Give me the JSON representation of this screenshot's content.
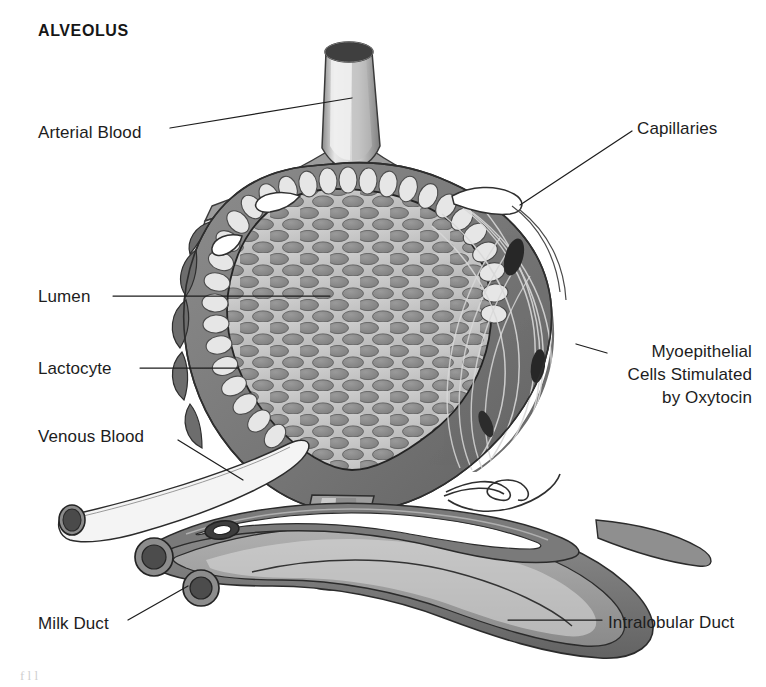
{
  "figure": {
    "title": "ALVEOLUS",
    "width": 766,
    "height": 687,
    "background": "#ffffff",
    "caption_fragment": "f      l      l"
  },
  "palette": {
    "ink": "#1d1d1d",
    "outline": "#2b2b2b",
    "wall_dark": "#6f6f6f",
    "wall_mid": "#8d8d8d",
    "wall_light": "#b7b7b7",
    "lumen_bg": "#c6c6c6",
    "globule": "#8a8a8a",
    "lactocyte": "#e2e2e2",
    "vessel_fill": "#dcdcdc",
    "vessel_wall": "#7d7d7d",
    "nucleus": "#3a3a3a",
    "duct_dark": "#6b6b6b",
    "duct_mid": "#9a9a9a",
    "white": "#ffffff"
  },
  "labels": [
    {
      "id": "arterial-blood",
      "text": "Arterial Blood",
      "x": 38,
      "y": 121,
      "anchor": "left",
      "leader": {
        "x1": 170,
        "y1": 128,
        "x2": 352,
        "y2": 98
      }
    },
    {
      "id": "capillaries",
      "text": "Capillaries",
      "x": 637,
      "y": 117,
      "anchor": "left",
      "leader": {
        "x1": 632,
        "y1": 131,
        "x2": 520,
        "y2": 205
      }
    },
    {
      "id": "lumen",
      "text": "Lumen",
      "x": 38,
      "y": 285,
      "anchor": "left",
      "leader": {
        "x1": 113,
        "y1": 296,
        "x2": 330,
        "y2": 296
      }
    },
    {
      "id": "lactocyte",
      "text": "Lactocyte",
      "x": 38,
      "y": 357,
      "anchor": "left",
      "leader": {
        "x1": 140,
        "y1": 368,
        "x2": 238,
        "y2": 368
      }
    },
    {
      "id": "myoepithelial",
      "text": "Myoepithelial\nCells Stimulated\nby Oxytocin",
      "lines": [
        "Myoepithelial",
        "Cells Stimulated",
        "by Oxytocin"
      ],
      "x": 612,
      "y": 340,
      "anchor": "left",
      "leader": {
        "x1": 607,
        "y1": 353,
        "x2": 578,
        "y2": 345
      }
    },
    {
      "id": "venous-blood",
      "text": "Venous Blood",
      "x": 38,
      "y": 425,
      "anchor": "left",
      "leader": {
        "x1": 178,
        "y1": 440,
        "x2": 240,
        "y2": 478
      }
    },
    {
      "id": "milk-duct",
      "text": "Milk Duct",
      "x": 38,
      "y": 612,
      "anchor": "left",
      "leader": {
        "x1": 128,
        "y1": 620,
        "x2": 186,
        "y2": 587
      }
    },
    {
      "id": "intralobular-duct",
      "text": "Intralobular Duct",
      "x": 608,
      "y": 611,
      "anchor": "left",
      "leader": {
        "x1": 602,
        "y1": 620,
        "x2": 508,
        "y2": 620
      }
    }
  ],
  "structures": [
    {
      "id": "arterial-vessel",
      "name": "Arterial blood vessel",
      "kind": "vessel"
    },
    {
      "id": "venous-vessel",
      "name": "Venous blood vessel",
      "kind": "vessel"
    },
    {
      "id": "alveolus-body",
      "name": "Alveolus wall",
      "kind": "tissue"
    },
    {
      "id": "lumen-region",
      "name": "Alveolar lumen with milk globules",
      "kind": "lumen"
    },
    {
      "id": "lactocyte-ring",
      "name": "Ring of lactocytes",
      "kind": "cells"
    },
    {
      "id": "myoepithelial-band",
      "name": "Myoepithelial cell fibres",
      "kind": "cells"
    },
    {
      "id": "capillary-network",
      "name": "Capillary network",
      "kind": "vessel"
    },
    {
      "id": "milk-duct-group",
      "name": "Milk duct cross sections",
      "kind": "duct"
    },
    {
      "id": "intralobular-duct-body",
      "name": "Intralobular duct",
      "kind": "duct"
    }
  ]
}
